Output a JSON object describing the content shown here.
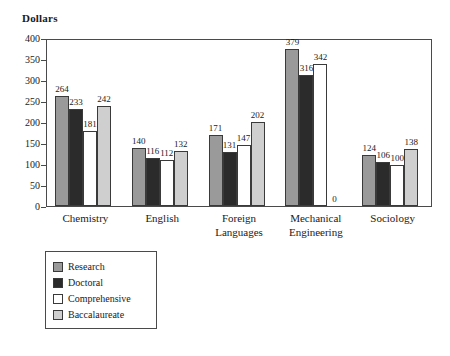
{
  "chart_data": {
    "type": "bar",
    "title": "Dollars",
    "xlabel": "",
    "ylabel": "Dollars",
    "ylim": [
      0,
      400
    ],
    "yticks": [
      0,
      50,
      100,
      150,
      200,
      250,
      300,
      350,
      400
    ],
    "grid": false,
    "legend_position": "bottom-left",
    "categories": [
      "Chemistry",
      "English",
      "Foreign Languages",
      "Mechanical Engineering",
      "Sociology"
    ],
    "series": [
      {
        "name": "Research",
        "color": "#9a9a9a",
        "values": [
          264,
          140,
          171,
          379,
          124
        ]
      },
      {
        "name": "Doctoral",
        "color": "#2b2b2b",
        "values": [
          233,
          116,
          131,
          316,
          106
        ]
      },
      {
        "name": "Comprehensive",
        "color": "#ffffff",
        "values": [
          181,
          112,
          147,
          342,
          100
        ]
      },
      {
        "name": "Baccalaureate",
        "color": "#cfcfcf",
        "values": [
          242,
          132,
          202,
          0,
          138
        ]
      }
    ]
  },
  "axis": {
    "tick_labels": [
      "400",
      "350",
      "300",
      "250",
      "200",
      "150",
      "100",
      "50",
      "0"
    ],
    "category_labels": [
      [
        "Chemistry"
      ],
      [
        "English"
      ],
      [
        "Foreign",
        "Languages"
      ],
      [
        "Mechanical",
        "Engineering"
      ],
      [
        "Sociology"
      ]
    ]
  },
  "legend": {
    "items": [
      {
        "label": "Research",
        "color": "#9a9a9a"
      },
      {
        "label": "Doctoral",
        "color": "#2b2b2b"
      },
      {
        "label": "Comprehensive",
        "color": "#ffffff"
      },
      {
        "label": "Baccalaureate",
        "color": "#cfcfcf"
      }
    ]
  }
}
